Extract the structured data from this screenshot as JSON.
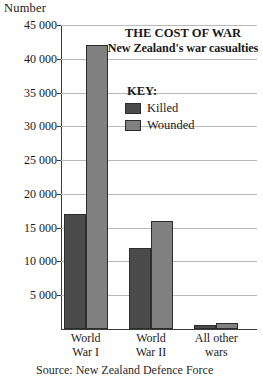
{
  "chart_data": {
    "type": "bar",
    "title": "THE COST OF WAR",
    "subtitle": "New Zealand's war casualties",
    "ylabel": "Number",
    "xlabel": "",
    "ylim": [
      0,
      45000
    ],
    "grid": true,
    "legend_position": "inside-top-center",
    "legend_title": "KEY:",
    "categories": [
      "World War I",
      "World War II",
      "All other wars"
    ],
    "category_lines": [
      [
        "World",
        "War I"
      ],
      [
        "World",
        "War II"
      ],
      [
        "All other",
        "wars"
      ]
    ],
    "y_ticks": [
      0,
      5000,
      10000,
      15000,
      20000,
      25000,
      30000,
      35000,
      40000,
      45000
    ],
    "y_tick_labels": [
      "",
      "5 000",
      "10 000",
      "15 000",
      "20 000",
      "25 000",
      "30 000",
      "35 000",
      "40 000",
      "45 000"
    ],
    "series": [
      {
        "name": "Killed",
        "color": "#4b4b4b",
        "values": [
          17000,
          12000,
          550
        ]
      },
      {
        "name": "Wounded",
        "color": "#808080",
        "values": [
          42000,
          16000,
          900
        ]
      }
    ],
    "source_note": "Source: New Zealand Defence Force"
  }
}
